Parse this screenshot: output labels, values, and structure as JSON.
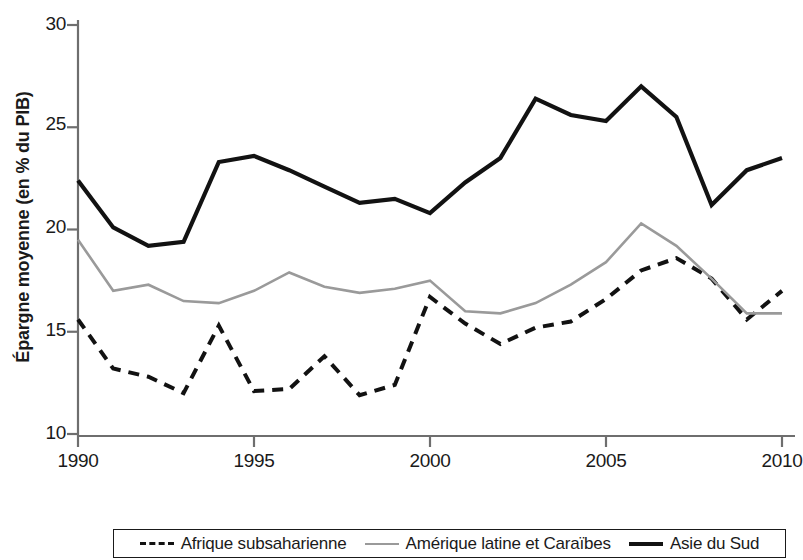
{
  "chart_data": {
    "type": "line",
    "title": "",
    "xlabel": "Année",
    "ylabel": "Épargne moyenne (en % du PIB)",
    "xlim": [
      1990,
      2010
    ],
    "ylim": [
      10,
      30
    ],
    "xticks": [
      1990,
      1995,
      2000,
      2005,
      2010
    ],
    "yticks": [
      10,
      15,
      20,
      25,
      30
    ],
    "xtick_labels": [
      "1990",
      "1995",
      "2000",
      "2005",
      "2010"
    ],
    "ytick_labels": [
      "10",
      "15",
      "20",
      "25",
      "30"
    ],
    "grid": false,
    "legend_position": "below",
    "x": [
      1990,
      1991,
      1992,
      1993,
      1994,
      1995,
      1996,
      1997,
      1998,
      1999,
      2000,
      2001,
      2002,
      2003,
      2004,
      2005,
      2006,
      2007,
      2008,
      2009,
      2010
    ],
    "series": [
      {
        "name": "Afrique subsaharienne",
        "style": "dashed",
        "color": "#121212",
        "values": [
          15.6,
          13.2,
          12.8,
          12.0,
          15.3,
          12.1,
          12.2,
          13.8,
          11.9,
          12.4,
          16.7,
          15.4,
          14.4,
          15.2,
          15.5,
          16.6,
          18.0,
          18.6,
          17.6,
          15.6,
          17.0
        ]
      },
      {
        "name": "Amérique latine et Caraïbes",
        "style": "solid",
        "color": "#9a9a9a",
        "values": [
          19.5,
          17.0,
          17.3,
          16.5,
          16.4,
          17.0,
          17.9,
          17.2,
          16.9,
          17.1,
          17.5,
          16.0,
          15.9,
          16.4,
          17.3,
          18.4,
          20.3,
          19.2,
          17.6,
          15.9,
          15.9
        ]
      },
      {
        "name": "Asie du Sud",
        "style": "solid",
        "color": "#121212",
        "values": [
          22.4,
          20.1,
          19.2,
          19.4,
          23.3,
          23.6,
          22.9,
          22.1,
          21.3,
          21.5,
          20.8,
          22.3,
          23.5,
          26.4,
          25.6,
          25.3,
          27.0,
          25.5,
          21.2,
          22.9,
          23.5
        ]
      }
    ]
  },
  "legend": {
    "entries": [
      {
        "label": "Afrique subsaharienne",
        "swatch": "dashed-line-black"
      },
      {
        "label": "Amérique latine et Caraïbes",
        "swatch": "solid-line-gray"
      },
      {
        "label": "Asie du Sud",
        "swatch": "solid-line-black"
      }
    ]
  }
}
